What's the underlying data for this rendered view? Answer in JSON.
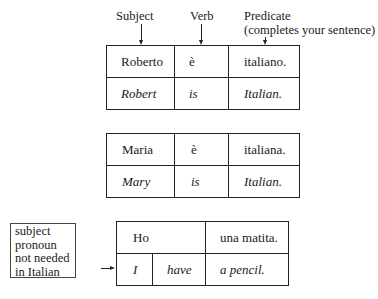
{
  "headers": {
    "subject": "Subject",
    "verb": "Verb",
    "predicate_line1": "Predicate",
    "predicate_line2": "(completes your sentence)"
  },
  "examples": [
    {
      "italian": {
        "subject": "Roberto",
        "verb": "è",
        "predicate": "italiano."
      },
      "english": {
        "subject": "Robert",
        "verb": "is",
        "predicate": "Italian."
      }
    },
    {
      "italian": {
        "subject": "Maria",
        "verb": "è",
        "predicate": "italiana."
      },
      "english": {
        "subject": "Mary",
        "verb": "is",
        "predicate": "Italian."
      }
    },
    {
      "italian": {
        "subject_verb": "Ho",
        "predicate": "una matita."
      },
      "english": {
        "subject": "I",
        "verb": "have",
        "predicate": "a pencil."
      }
    }
  ],
  "note": {
    "lines": [
      "subject",
      "pronoun",
      "not needed",
      "in Italian"
    ]
  }
}
